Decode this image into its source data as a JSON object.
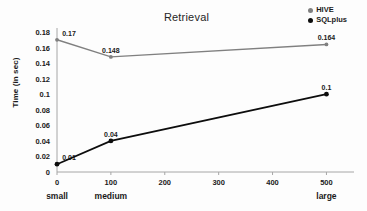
{
  "chart_data": {
    "type": "line",
    "title": "Retrieval",
    "xlabel": "",
    "ylabel": "Time (in sec)",
    "x": [
      0,
      100,
      500
    ],
    "x_category_labels": [
      "small",
      "medium",
      "large"
    ],
    "xlim": [
      0,
      540
    ],
    "ylim": [
      0,
      0.18
    ],
    "xticks": [
      "0",
      "100",
      "200",
      "300",
      "400",
      "500"
    ],
    "xtick_values": [
      0,
      100,
      200,
      300,
      400,
      500
    ],
    "yticks": [
      "0",
      "0.02",
      "0.04",
      "0.06",
      "0.08",
      "0.1",
      "0.12",
      "0.14",
      "0.16",
      "0.18"
    ],
    "ytick_values": [
      0,
      0.02,
      0.04,
      0.06,
      0.08,
      0.1,
      0.12,
      0.14,
      0.16,
      0.18
    ],
    "grid": false,
    "legend_position": "top-right",
    "series": [
      {
        "name": "HIVE",
        "color": "#808080",
        "marker": "circle",
        "values": [
          0.17,
          0.148,
          0.164
        ],
        "labels": [
          "0.17",
          "0.148",
          "0.164"
        ]
      },
      {
        "name": "SQLplus",
        "color": "#0d0d0d",
        "marker": "circle",
        "values": [
          0.01,
          0.04,
          0.1
        ],
        "labels": [
          "0.01",
          "0.04",
          "0.1"
        ]
      }
    ]
  },
  "colors": {
    "hive": "#808080",
    "sqlplus": "#0d0d0d",
    "axis": "#a6a6a6",
    "text": "#1a1a1a",
    "background": "#fdfdfd"
  }
}
